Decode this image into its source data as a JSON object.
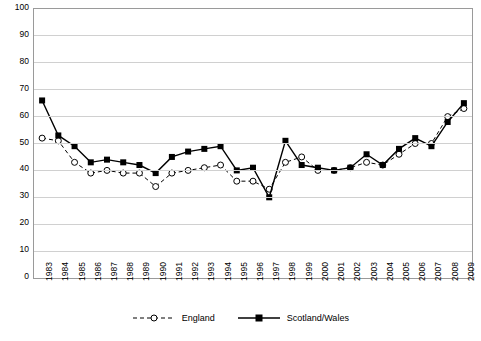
{
  "chart_data": {
    "type": "line",
    "title": "",
    "xlabel": "",
    "ylabel": "",
    "ylim": [
      0,
      100
    ],
    "ytick_step": 10,
    "yticks": [
      0,
      10,
      20,
      30,
      40,
      50,
      60,
      70,
      80,
      90,
      100
    ],
    "grid": true,
    "legend_position": "bottom",
    "categories": [
      "1983",
      "1984",
      "1985",
      "1986",
      "1987",
      "1988",
      "1989",
      "1990",
      "1991",
      "1992",
      "1993",
      "1994",
      "1995",
      "1996",
      "1997",
      "1998",
      "1999",
      "2000",
      "2001",
      "2002",
      "2003",
      "2004",
      "2005",
      "2006",
      "2007",
      "2008",
      "2009"
    ],
    "series": [
      {
        "name": "England",
        "marker": "open-circle",
        "line": "dashed",
        "color": "#000000",
        "values": [
          52,
          51,
          43,
          39,
          40,
          39,
          39,
          34,
          39,
          40,
          41,
          42,
          36,
          36,
          33,
          43,
          45,
          40,
          40,
          41,
          43,
          42,
          46,
          50,
          50,
          60,
          63
        ]
      },
      {
        "name": "Scotland/Wales",
        "marker": "filled-square",
        "line": "solid",
        "color": "#000000",
        "values": [
          66,
          53,
          49,
          43,
          44,
          43,
          42,
          39,
          45,
          47,
          48,
          49,
          40,
          41,
          30,
          51,
          42,
          41,
          40,
          41,
          46,
          42,
          48,
          52,
          49,
          58,
          65
        ]
      }
    ]
  },
  "legend": {
    "entries": [
      {
        "label": "England"
      },
      {
        "label": "Scotland/Wales"
      }
    ]
  }
}
